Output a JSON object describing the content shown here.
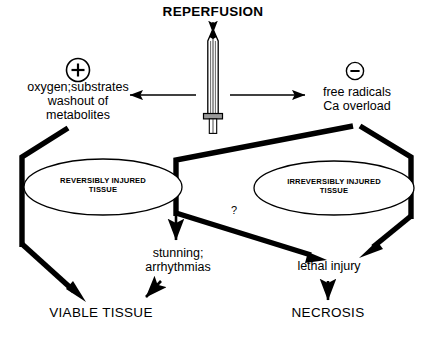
{
  "figure": {
    "type": "flow-diagram",
    "title": "REPERFUSION",
    "background_color": "#ffffff",
    "line_color": "#000000"
  },
  "nodes": {
    "title": "REPERFUSION",
    "sword_icon": "sword-icon",
    "plus_sign": "+",
    "minus_sign": "–",
    "beneficial_effects": "oxygen;substrates\nwashout of\nmetabolites",
    "detrimental_effects": "free radicals\nCa overload",
    "reversible_tissue": "REVERSIBLY INJURED\nTISSUE",
    "irreversible_tissue": "IRREVERSIBLY INJURED\nTISSUE",
    "stunning": "stunning;\narrhythmias",
    "lethal_injury": "lethal injury",
    "question_mark": "?",
    "viable_tissue": "VIABLE TISSUE",
    "necrosis": "NECROSIS"
  },
  "flows": [
    {
      "from": "REPERFUSION",
      "to": "sword",
      "kind": "thin-arrow",
      "direction": "down"
    },
    {
      "from": "sword",
      "to": "oxygen;substrates washout of metabolites",
      "kind": "thin-arrow",
      "direction": "left"
    },
    {
      "from": "sword",
      "to": "free radicals Ca overload",
      "kind": "thin-arrow",
      "direction": "right"
    },
    {
      "from": "oxygen;substrates washout of metabolites",
      "to": "REVERSIBLY INJURED TISSUE",
      "kind": "thick-bracket"
    },
    {
      "from": "free radicals Ca overload",
      "to": "IRREVERSIBLY INJURED TISSUE",
      "kind": "thick-bracket"
    },
    {
      "from": "free radicals Ca overload",
      "to": "REVERSIBLY INJURED TISSUE",
      "kind": "thick-bracket"
    },
    {
      "from": "REVERSIBLY INJURED TISSUE",
      "to": "VIABLE TISSUE",
      "kind": "thick-arrow"
    },
    {
      "from": "REVERSIBLY INJURED TISSUE",
      "to": "stunning; arrhythmias",
      "kind": "thin-arrow",
      "direction": "down"
    },
    {
      "from": "REVERSIBLY INJURED TISSUE",
      "to": "lethal injury",
      "kind": "thick-arrow",
      "label": "?"
    },
    {
      "from": "IRREVERSIBLY INJURED TISSUE",
      "to": "lethal injury",
      "kind": "thick-arrow"
    },
    {
      "from": "stunning; arrhythmias",
      "to": "VIABLE TISSUE",
      "kind": "thin-arrow"
    },
    {
      "from": "lethal injury",
      "to": "NECROSIS",
      "kind": "thin-arrow",
      "direction": "down"
    }
  ]
}
